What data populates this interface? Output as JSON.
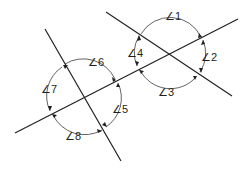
{
  "line_color": "#231f20",
  "background": "#ffffff",
  "angle_symbol": "∠",
  "lines": [
    {
      "id": "transversal",
      "name": "transversal-line"
    },
    {
      "id": "upper-line",
      "name": "upper-right-line"
    },
    {
      "id": "lower-line",
      "name": "lower-left-line"
    }
  ],
  "intersections": [
    {
      "id": "upper",
      "angles": [
        "∠1",
        "∠2",
        "∠3",
        "∠4"
      ]
    },
    {
      "id": "lower",
      "angles": [
        "∠5",
        "∠6",
        "∠7",
        "∠8"
      ]
    }
  ],
  "labels": {
    "a1": "∠1",
    "a2": "∠2",
    "a3": "∠3",
    "a4": "∠4",
    "a5": "∠5",
    "a6": "∠6",
    "a7": "∠7",
    "a8": "∠8"
  }
}
